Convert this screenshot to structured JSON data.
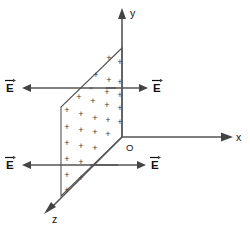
{
  "figure": {
    "background_color": "#ffffff",
    "line_color": "#555555",
    "text_color": "#111111"
  },
  "axes": {
    "y": {
      "label": "y",
      "label_x": 130,
      "label_y": 13,
      "x1": 122,
      "y1": 18,
      "x2": 122,
      "y2": 137
    },
    "x": {
      "label": "x",
      "label_x": 236,
      "label_y": 137,
      "x1": 122,
      "y1": 137,
      "x2": 226,
      "y2": 137
    },
    "z": {
      "label": "z",
      "label_x": 52,
      "label_y": 219,
      "x1": 122,
      "y1": 137,
      "x2": 50,
      "y2": 209
    },
    "origin": {
      "label": "O",
      "label_x": 126,
      "label_y": 147
    }
  },
  "plane": {
    "name": "charged-plane",
    "shape": "parallelogram",
    "corners": [
      {
        "x": 122,
        "y": 48
      },
      {
        "x": 61,
        "y": 107
      },
      {
        "x": 61,
        "y": 196
      },
      {
        "x": 122,
        "y": 137
      }
    ],
    "charge_symbol": "+",
    "charge_sign": "positive",
    "charge_positions": [
      {
        "x": 109,
        "y": 58
      },
      {
        "x": 120,
        "y": 62
      },
      {
        "x": 96,
        "y": 75
      },
      {
        "x": 109,
        "y": 80
      },
      {
        "x": 120,
        "y": 82
      },
      {
        "x": 107,
        "y": 92
      },
      {
        "x": 120,
        "y": 95
      },
      {
        "x": 79,
        "y": 97
      },
      {
        "x": 93,
        "y": 101
      },
      {
        "x": 107,
        "y": 105
      },
      {
        "x": 120,
        "y": 108
      },
      {
        "x": 67,
        "y": 110
      },
      {
        "x": 81,
        "y": 114
      },
      {
        "x": 95,
        "y": 118
      },
      {
        "x": 108,
        "y": 120
      },
      {
        "x": 120,
        "y": 122
      },
      {
        "x": 67,
        "y": 127
      },
      {
        "x": 81,
        "y": 130
      },
      {
        "x": 95,
        "y": 132
      },
      {
        "x": 108,
        "y": 134
      },
      {
        "x": 67,
        "y": 143
      },
      {
        "x": 81,
        "y": 146
      },
      {
        "x": 95,
        "y": 148
      },
      {
        "x": 67,
        "y": 159
      },
      {
        "x": 81,
        "y": 162
      },
      {
        "x": 67,
        "y": 175
      },
      {
        "x": 81,
        "y": 178
      },
      {
        "x": 67,
        "y": 190
      }
    ],
    "cross_mark": {
      "symbol": "×",
      "x": 91,
      "y": 88
    }
  },
  "field_vectors": [
    {
      "name": "field-vector-upper-left",
      "label": "E",
      "direction": "left",
      "tail_x": 116,
      "tail_y": 88,
      "tip_x": 22,
      "tip_y": 88,
      "label_x": 6,
      "label_y": 88
    },
    {
      "name": "field-vector-upper-right",
      "label": "E",
      "direction": "right",
      "tail_x": 106,
      "tail_y": 88,
      "tip_x": 148,
      "tip_y": 88,
      "label_x": 153,
      "label_y": 88
    },
    {
      "name": "field-vector-lower-left",
      "label": "E",
      "direction": "left",
      "tail_x": 118,
      "tail_y": 165,
      "tip_x": 22,
      "tip_y": 165,
      "label_x": 6,
      "label_y": 165
    },
    {
      "name": "field-vector-lower-right",
      "label": "E",
      "direction": "right",
      "tail_x": 90,
      "tail_y": 165,
      "tip_x": 146,
      "tip_y": 165,
      "label_x": 151,
      "label_y": 165
    }
  ]
}
